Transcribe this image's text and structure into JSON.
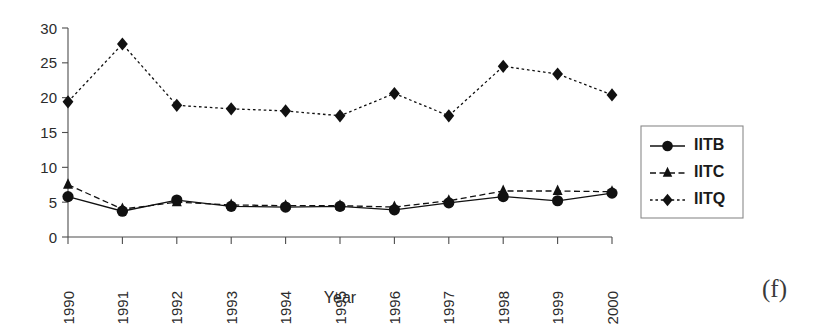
{
  "figure": {
    "panel_label": "(f)",
    "background_color": "#ffffff",
    "ink_color": "#111111"
  },
  "chart_data": {
    "type": "line",
    "title": "",
    "xlabel": "Year",
    "ylabel": "",
    "categories": [
      "1990",
      "1991",
      "1992",
      "1993",
      "1994",
      "1995",
      "1996",
      "1997",
      "1998",
      "1999",
      "2000"
    ],
    "x": [
      1990,
      1991,
      1992,
      1993,
      1994,
      1995,
      1996,
      1997,
      1998,
      1999,
      2000
    ],
    "xlim": [
      1990,
      2000
    ],
    "ylim": [
      0,
      30
    ],
    "yticks": [
      0,
      5,
      10,
      15,
      20,
      25,
      30
    ],
    "ytick_labels": [
      "0",
      "5",
      "10",
      "15",
      "20",
      "25",
      "30"
    ],
    "grid": false,
    "legend_position": "right",
    "series": [
      {
        "name": "IITB",
        "marker": "circle",
        "linestyle": "solid",
        "color": "#111111",
        "values": [
          5.8,
          3.7,
          5.3,
          4.4,
          4.3,
          4.4,
          3.9,
          4.9,
          5.8,
          5.2,
          6.3
        ]
      },
      {
        "name": "IITC",
        "marker": "triangle",
        "linestyle": "dashed",
        "color": "#111111",
        "values": [
          7.5,
          4.0,
          5.0,
          4.6,
          4.5,
          4.5,
          4.3,
          5.2,
          6.6,
          6.6,
          6.5
        ]
      },
      {
        "name": "IITQ",
        "marker": "diamond",
        "linestyle": "dotted",
        "color": "#111111",
        "values": [
          19.4,
          27.7,
          18.9,
          18.4,
          18.1,
          17.4,
          20.6,
          17.4,
          24.5,
          23.4,
          20.4
        ]
      }
    ]
  },
  "legend": {
    "entries": [
      {
        "label": "IITB",
        "marker": "circle-marker",
        "linestyle": "solid"
      },
      {
        "label": "IITC",
        "marker": "triangle-marker",
        "linestyle": "dashed"
      },
      {
        "label": "IITQ",
        "marker": "diamond-marker",
        "linestyle": "dotted"
      }
    ]
  }
}
